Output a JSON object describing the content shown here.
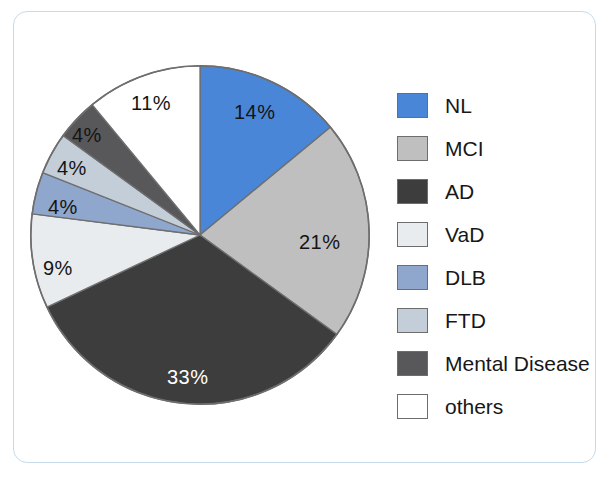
{
  "figure": {
    "frame_color": "#c5daea",
    "background": "#ffffff"
  },
  "chart_data": {
    "type": "pie",
    "title": "",
    "categories": [
      "NL",
      "MCI",
      "AD",
      "VaD",
      "DLB",
      "FTD",
      "Mental Disease",
      "others"
    ],
    "values": [
      14,
      21,
      33,
      9,
      4,
      4,
      4,
      11
    ],
    "unit": "%",
    "data_labels": [
      "14%",
      "21%",
      "33%",
      "9%",
      "4%",
      "4%",
      "4%",
      "11%"
    ],
    "colors": [
      "#4a86d8",
      "#bfbfbf",
      "#3d3d3d",
      "#e8ecee",
      "#8fa7cc",
      "#c3ced9",
      "#58585a",
      "#ffffff"
    ],
    "label_text_colors": [
      "#141414",
      "#141414",
      "#ffffff",
      "#141414",
      "#141414",
      "#141414",
      "#141414",
      "#141414"
    ],
    "start_angle_deg": 0,
    "direction": "clockwise",
    "legend_position": "right",
    "grid": false,
    "xlabel": "",
    "ylabel": ""
  },
  "legend": {
    "items": [
      {
        "label": "NL",
        "color": "#4a86d8"
      },
      {
        "label": "MCI",
        "color": "#bfbfbf"
      },
      {
        "label": "AD",
        "color": "#3d3d3d"
      },
      {
        "label": "VaD",
        "color": "#e8ecee"
      },
      {
        "label": "DLB",
        "color": "#8fa7cc"
      },
      {
        "label": "FTD",
        "color": "#c3ced9"
      },
      {
        "label": "Mental Disease",
        "color": "#58585a"
      },
      {
        "label": "others",
        "color": "#ffffff"
      }
    ]
  },
  "pie_labels": [
    {
      "text": "14%",
      "x": 234,
      "y": 101,
      "light": false
    },
    {
      "text": "21%",
      "x": 299,
      "y": 231,
      "light": false
    },
    {
      "text": "33%",
      "x": 167,
      "y": 366,
      "light": true
    },
    {
      "text": "9%",
      "x": 43,
      "y": 257,
      "light": false
    },
    {
      "text": "4%",
      "x": 48,
      "y": 196,
      "light": false
    },
    {
      "text": "4%",
      "x": 57,
      "y": 157,
      "light": false
    },
    {
      "text": "4%",
      "x": 72,
      "y": 124,
      "light": false
    },
    {
      "text": "11%",
      "x": 131,
      "y": 92,
      "light": false
    }
  ]
}
